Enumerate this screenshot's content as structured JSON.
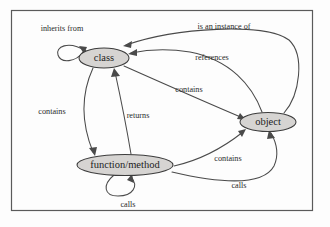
{
  "figure": {
    "type": "directed-graph",
    "background_color": "#fdfdfd",
    "frame_color": "#5a5a5a",
    "node_fill_color": "#d6d4d2",
    "node_stroke_color": "#3c3c3c",
    "edge_color": "#4a4a4a",
    "text_color": "#1d1d1d"
  },
  "nodes": [
    {
      "id": "class",
      "label": "class",
      "cx": 104,
      "cy": 58,
      "rx": 25,
      "ry": 10,
      "font_size": 10.5
    },
    {
      "id": "object",
      "label": "object",
      "cx": 268,
      "cy": 122,
      "rx": 28,
      "ry": 9.5,
      "font_size": 10.5
    },
    {
      "id": "function_method",
      "label": "function/method",
      "cx": 125,
      "cy": 165,
      "rx": 48,
      "ry": 10.5,
      "font_size": 10.5
    }
  ],
  "edges": [
    {
      "id": "inherits-from",
      "label": "inherits from",
      "from": "class",
      "to": "class",
      "kind": "self-loop",
      "label_x": 62,
      "label_y": 29,
      "font_size": 8.2
    },
    {
      "id": "is-an-instance-of",
      "label": "is an instance of",
      "from": "object",
      "to": "class",
      "kind": "arc",
      "label_x": 224,
      "label_y": 27,
      "font_size": 8.2
    },
    {
      "id": "references",
      "label": "references",
      "from": "object",
      "to": "class",
      "kind": "arc",
      "label_x": 212,
      "label_y": 58,
      "font_size": 8.2
    },
    {
      "id": "contains-class-object",
      "label": "contains",
      "from": "class",
      "to": "object",
      "kind": "arc",
      "label_x": 189,
      "label_y": 90,
      "font_size": 8.2
    },
    {
      "id": "contains-class-function",
      "label": "contains",
      "from": "class",
      "to": "function/method",
      "kind": "arc",
      "label_x": 52,
      "label_y": 112,
      "font_size": 8.2
    },
    {
      "id": "returns",
      "label": "returns",
      "from": "function/method",
      "to": "class",
      "kind": "arc",
      "label_x": 138,
      "label_y": 116,
      "font_size": 8.2
    },
    {
      "id": "contains-function-object",
      "label": "contains",
      "from": "function/method",
      "to": "object",
      "kind": "arc",
      "label_x": 228,
      "label_y": 159,
      "font_size": 8.2
    },
    {
      "id": "calls-function-object",
      "label": "calls",
      "from": "function/method",
      "to": "object",
      "kind": "arc",
      "label_x": 239,
      "label_y": 186,
      "font_size": 8.2
    },
    {
      "id": "calls-self",
      "label": "calls",
      "from": "function/method",
      "to": "function/method",
      "kind": "self-loop",
      "label_x": 128,
      "label_y": 205,
      "font_size": 8.2
    }
  ],
  "frame": {
    "x": 11.5,
    "y": 10.5,
    "width": 301,
    "height": 200
  }
}
